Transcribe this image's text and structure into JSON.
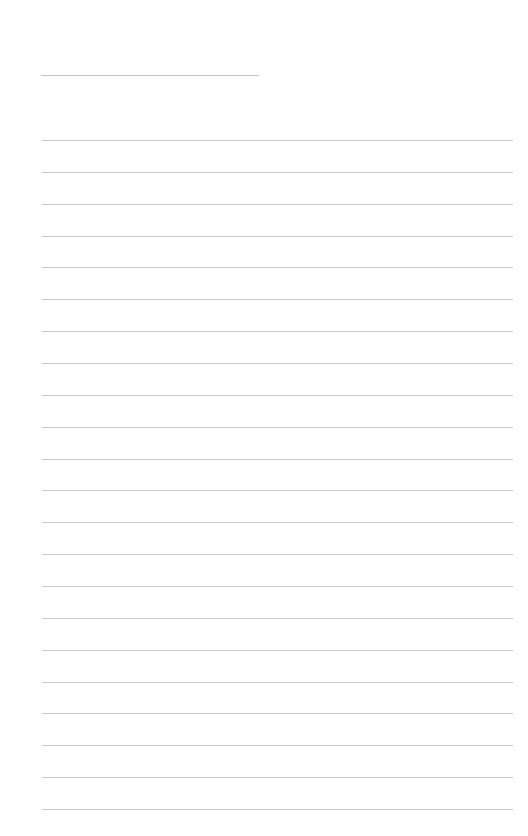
{
  "page": {
    "type": "blank lined paper",
    "title_line": {
      "text": ""
    },
    "line_color": "#c8c8c8",
    "lines": [
      {
        "text": ""
      },
      {
        "text": ""
      },
      {
        "text": ""
      },
      {
        "text": ""
      },
      {
        "text": ""
      },
      {
        "text": ""
      },
      {
        "text": ""
      },
      {
        "text": ""
      },
      {
        "text": ""
      },
      {
        "text": ""
      },
      {
        "text": ""
      },
      {
        "text": ""
      },
      {
        "text": ""
      },
      {
        "text": ""
      },
      {
        "text": ""
      },
      {
        "text": ""
      },
      {
        "text": ""
      },
      {
        "text": ""
      },
      {
        "text": ""
      },
      {
        "text": ""
      },
      {
        "text": ""
      },
      {
        "text": ""
      }
    ]
  }
}
